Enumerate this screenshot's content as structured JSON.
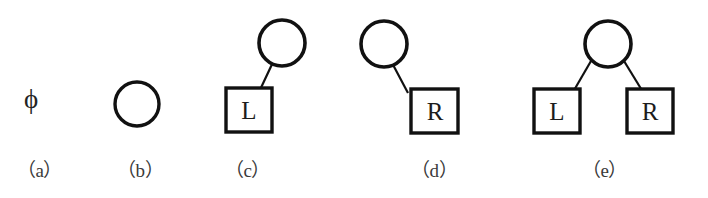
{
  "figure": {
    "background_color": "#ffffff",
    "stroke_color": "#111111",
    "text_color": "#1c1c1c",
    "caption_color": "#3a3a3a",
    "empty_tree_symbol": "ϕ"
  },
  "panels": [
    {
      "id": "a",
      "caption": "（a）",
      "kind": "empty",
      "symbol": "ϕ",
      "nodes": [],
      "edges": []
    },
    {
      "id": "b",
      "caption": "（b）",
      "kind": "root-only",
      "nodes": [
        {
          "name": "root",
          "shape": "circle",
          "label": ""
        }
      ],
      "edges": []
    },
    {
      "id": "c",
      "caption": "（c）",
      "kind": "left-subtree",
      "nodes": [
        {
          "name": "root",
          "shape": "circle",
          "label": ""
        },
        {
          "name": "left-child",
          "shape": "square",
          "label": "L"
        }
      ],
      "edges": [
        {
          "from": "root",
          "to": "left-child"
        }
      ]
    },
    {
      "id": "d",
      "caption": "（d）",
      "kind": "right-subtree",
      "nodes": [
        {
          "name": "root",
          "shape": "circle",
          "label": ""
        },
        {
          "name": "right-child",
          "shape": "square",
          "label": "R"
        }
      ],
      "edges": [
        {
          "from": "root",
          "to": "right-child"
        }
      ]
    },
    {
      "id": "e",
      "caption": "（e）",
      "kind": "both-subtrees",
      "nodes": [
        {
          "name": "root",
          "shape": "circle",
          "label": ""
        },
        {
          "name": "left-child",
          "shape": "square",
          "label": "L"
        },
        {
          "name": "right-child",
          "shape": "square",
          "label": "R"
        }
      ],
      "edges": [
        {
          "from": "root",
          "to": "left-child"
        },
        {
          "from": "root",
          "to": "right-child"
        }
      ]
    }
  ]
}
